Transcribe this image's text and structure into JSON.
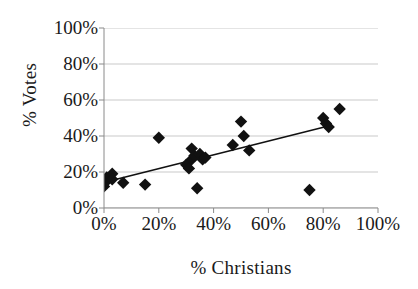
{
  "chart_data": {
    "type": "scatter",
    "title": "",
    "xlabel": "% Christians",
    "ylabel": "% Votes",
    "xlim": [
      0,
      100
    ],
    "ylim": [
      0,
      100
    ],
    "xticks": [
      "0%",
      "20%",
      "40%",
      "60%",
      "80%",
      "100%"
    ],
    "xtick_values": [
      0,
      20,
      40,
      60,
      80,
      100
    ],
    "yticks": [
      "0%",
      "20%",
      "40%",
      "60%",
      "80%",
      "100%"
    ],
    "ytick_values": [
      0,
      20,
      40,
      60,
      80,
      100
    ],
    "grid": "horizontal",
    "legend": "none",
    "marker": "diamond",
    "marker_color": "#111111",
    "series": [
      {
        "name": "observations",
        "points": [
          [
            0,
            12
          ],
          [
            1,
            15
          ],
          [
            1,
            17
          ],
          [
            3,
            19
          ],
          [
            3,
            16
          ],
          [
            7,
            14
          ],
          [
            15,
            13
          ],
          [
            20,
            39
          ],
          [
            30,
            24
          ],
          [
            31,
            22
          ],
          [
            32,
            33
          ],
          [
            32,
            27
          ],
          [
            33,
            29
          ],
          [
            34,
            11
          ],
          [
            35,
            30
          ],
          [
            36,
            27
          ],
          [
            37,
            28
          ],
          [
            47,
            35
          ],
          [
            50,
            48
          ],
          [
            51,
            40
          ],
          [
            53,
            32
          ],
          [
            75,
            10
          ],
          [
            80,
            50
          ],
          [
            81,
            47
          ],
          [
            82,
            45
          ],
          [
            86,
            55
          ]
        ]
      }
    ],
    "trendline": {
      "type": "linear",
      "x_start": 2,
      "y_start": 15,
      "x_end": 83,
      "y_end": 46,
      "color": "#111111"
    }
  },
  "axes": {
    "y_axis_title": "% Votes",
    "x_axis_title": "% Christians"
  },
  "style": {
    "background": "#ffffff",
    "gridline_color": "#c9c9c9",
    "axis_color": "#8a8a8a",
    "marker_color": "#111111",
    "trendline_color": "#111111"
  }
}
